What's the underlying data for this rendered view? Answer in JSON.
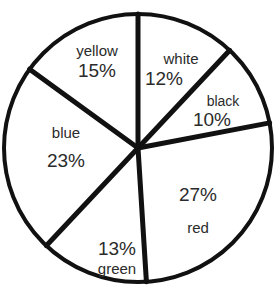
{
  "chart_data": {
    "type": "pie",
    "title": "",
    "unit": "%",
    "total": 100,
    "legend_position": "none",
    "labels_inside_slices": true,
    "geometry": {
      "center_x": 138,
      "center_y": 148,
      "radius": 134,
      "start_angle_deg": -90,
      "direction": "clockwise",
      "stroke_color": "#111111",
      "outline_width": 4,
      "divider_width": 5,
      "fill": "none"
    },
    "categories": [
      "white",
      "black",
      "red",
      "green",
      "blue",
      "yellow"
    ],
    "values": [
      12,
      10,
      27,
      13,
      23,
      15
    ],
    "slices": [
      {
        "name": "white",
        "value": 12,
        "pct_text": "12%",
        "start_deg": -90,
        "end_deg": -46.8,
        "label_x": 181,
        "label_y": 70,
        "label_order": "name-then-pct"
      },
      {
        "name": "black",
        "value": 10,
        "pct_text": "10%",
        "start_deg": -46.8,
        "end_deg": -10.8,
        "label_x": 223,
        "label_y": 112,
        "label_order": "name-then-pct"
      },
      {
        "name": "red",
        "value": 27,
        "pct_text": "27%",
        "start_deg": -10.8,
        "end_deg": 86.4,
        "label_x": 198,
        "label_y": 210,
        "label_order": "pct-then-name"
      },
      {
        "name": "green",
        "value": 13,
        "pct_text": "13%",
        "start_deg": 86.4,
        "end_deg": 133.2,
        "label_x": 117,
        "label_y": 258,
        "label_order": "pct-then-name"
      },
      {
        "name": "blue",
        "value": 23,
        "pct_text": "23%",
        "start_deg": 133.2,
        "end_deg": 216.0,
        "label_x": 66,
        "label_y": 148,
        "label_order": "name-then-pct"
      },
      {
        "name": "yellow",
        "value": 15,
        "pct_text": "15%",
        "start_deg": 216.0,
        "end_deg": 270.0,
        "label_x": 97,
        "label_y": 62,
        "label_order": "name-then-pct"
      }
    ],
    "colors": {
      "background": "#ffffff",
      "slice_fill": "#ffffff",
      "stroke": "#111111",
      "text": "#2b2b2b"
    }
  }
}
